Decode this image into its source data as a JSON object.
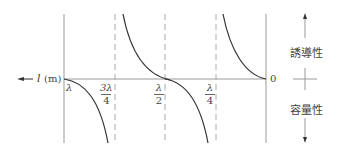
{
  "diagram": {
    "axis_label_var": "l",
    "axis_label_unit": "(m)",
    "origin_label": "0",
    "ticks": [
      {
        "name": "lambda",
        "label": "λ"
      },
      {
        "name": "three-quarter-lambda",
        "num": "3λ",
        "den": "4"
      },
      {
        "name": "half-lambda",
        "num": "λ",
        "den": "2"
      },
      {
        "name": "quarter-lambda",
        "num": "λ",
        "den": "4"
      }
    ],
    "legend": {
      "upper": "誘導性",
      "lower": "容量性"
    },
    "colors": {
      "curve": "#333333",
      "axis": "#999999",
      "dashed": "#aaaaaa"
    }
  }
}
